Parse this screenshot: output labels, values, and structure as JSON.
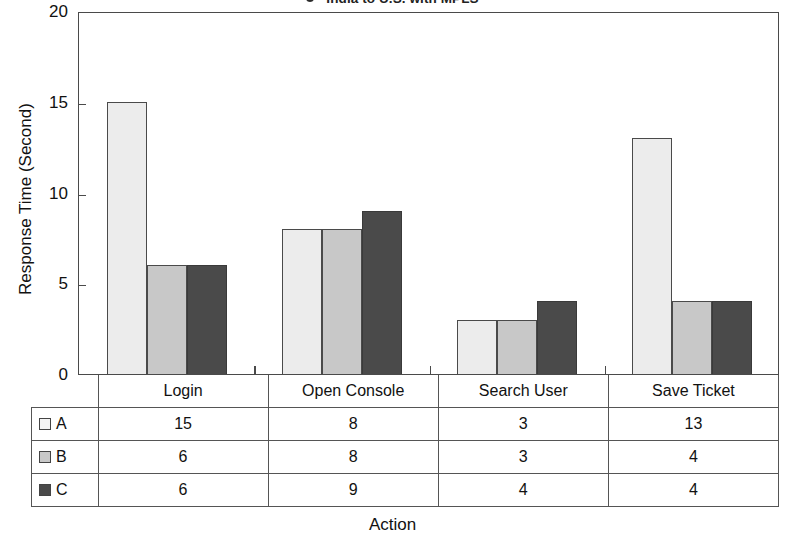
{
  "top_caption": {
    "marker": "legend-dot",
    "text": "India to U.S. with MPLS"
  },
  "axis": {
    "y_title": "Response Time (Second)",
    "x_title": "Action"
  },
  "table": {
    "header_key": "",
    "columns": [
      "Login",
      "Open Console",
      "Search User",
      "Save Ticket"
    ],
    "rows": [
      {
        "key": "A",
        "swatch": "s0",
        "values": [
          "15",
          "8",
          "3",
          "13"
        ]
      },
      {
        "key": "B",
        "swatch": "s1",
        "values": [
          "6",
          "8",
          "3",
          "4"
        ]
      },
      {
        "key": "C",
        "swatch": "s2",
        "values": [
          "6",
          "9",
          "4",
          "4"
        ]
      }
    ]
  },
  "chart_data": {
    "type": "bar",
    "title": "India to U.S. with MPLS",
    "xlabel": "Action",
    "ylabel": "Response Time (Second)",
    "ylim": [
      0,
      20
    ],
    "yticks": [
      0,
      5,
      10,
      15,
      20
    ],
    "grid": false,
    "legend_position": "table-below",
    "categories": [
      "Login",
      "Open Console",
      "Search User",
      "Save Ticket"
    ],
    "series": [
      {
        "name": "A",
        "color": "#ececec",
        "values": [
          15,
          8,
          3,
          13
        ]
      },
      {
        "name": "B",
        "color": "#c8c8c8",
        "values": [
          6,
          8,
          3,
          4
        ]
      },
      {
        "name": "C",
        "color": "#4a4a4a",
        "values": [
          6,
          9,
          4,
          4
        ]
      }
    ]
  }
}
